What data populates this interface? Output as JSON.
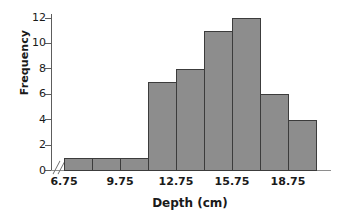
{
  "chart_data": {
    "type": "bar",
    "title": "",
    "subtitle": "",
    "xlabel": "Depth (cm)",
    "ylabel": "Frequency",
    "categories": [
      "6.75-8.25",
      "8.25-9.75",
      "9.75-11.25",
      "11.25-12.75",
      "12.75-14.25",
      "14.25-15.75",
      "15.75-17.25",
      "17.25-18.75",
      "18.75-20.25"
    ],
    "bin_edges": [
      6.75,
      8.25,
      9.75,
      11.25,
      12.75,
      14.25,
      15.75,
      17.25,
      18.75,
      20.25
    ],
    "bin_width": 1.5,
    "values": [
      1,
      1,
      1,
      7,
      8,
      11,
      12,
      6,
      4
    ],
    "total_count": 51,
    "xlim": [
      6.75,
      20.25
    ],
    "ylim": [
      0,
      12
    ],
    "x_ticks": [
      6.75,
      9.75,
      12.75,
      15.75,
      18.75
    ],
    "x_tick_labels": [
      "6.75",
      "9.75",
      "12.75",
      "15.75",
      "18.75"
    ],
    "y_ticks": [
      0,
      2,
      4,
      6,
      8,
      10,
      12
    ],
    "y_tick_labels": [
      "0",
      "2",
      "4",
      "6",
      "8",
      "10",
      "12"
    ],
    "grid": false,
    "legend": false,
    "legend_position": "none",
    "axis_break": "//",
    "bar_fill_color": "#8d8d8d",
    "bar_edge_color": "#3c3c3c",
    "axis_color": "#5d5d5d",
    "background_color": "#ffffff"
  }
}
